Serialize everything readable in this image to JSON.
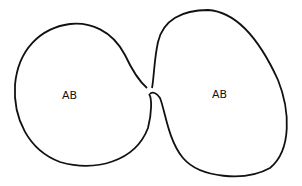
{
  "diagram": {
    "left_region": {
      "label": "AB"
    },
    "right_region": {
      "label": "AB"
    },
    "stroke_color": "#111111",
    "background": "#ffffff"
  }
}
